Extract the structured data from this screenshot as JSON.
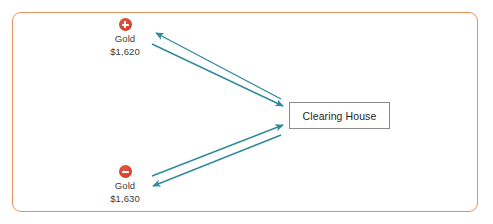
{
  "diagram": {
    "title_text": "",
    "frame": {
      "border_color": "#e2905c",
      "background": "#ffffff"
    },
    "accent_arrow_color": "#2e8b9b",
    "nodes": [
      {
        "id": "gold-buy",
        "icon": "plus-circle-icon",
        "icon_color": "#d8442c",
        "label": "Gold",
        "price": "$1,620"
      },
      {
        "id": "gold-sell",
        "icon": "minus-circle-icon",
        "icon_color": "#d8442c",
        "label": "Gold",
        "price": "$1,630"
      }
    ],
    "clearing_house": {
      "label": "Clearing House",
      "border_color": "#8a8a8a"
    },
    "connectors": [
      {
        "id": "buy-to-house",
        "from": "gold-buy",
        "to": "clearing-house",
        "direction": "to-clearing-house"
      },
      {
        "id": "house-to-buy",
        "from": "clearing-house",
        "to": "gold-buy",
        "direction": "from-clearing-house"
      },
      {
        "id": "sell-to-house",
        "from": "gold-sell",
        "to": "clearing-house",
        "direction": "to-clearing-house"
      },
      {
        "id": "house-to-sell",
        "from": "clearing-house",
        "to": "gold-sell",
        "direction": "from-clearing-house"
      }
    ]
  }
}
